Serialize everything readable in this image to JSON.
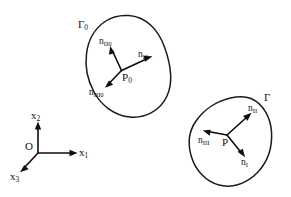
{
  "figure": {
    "background_color": "#ffffff",
    "stroke_color": "#1a1a1a",
    "width": 291,
    "height": 197
  },
  "coordinate_frame": {
    "origin_label": "O",
    "axes": [
      {
        "name": "x1",
        "base": "x",
        "sub": "1",
        "direction": "right"
      },
      {
        "name": "x2",
        "base": "x",
        "sub": "2",
        "direction": "up"
      },
      {
        "name": "x3",
        "base": "x",
        "sub": "3",
        "direction": "down-left"
      }
    ]
  },
  "bodies": [
    {
      "id": "reference-body",
      "boundary_label": {
        "base": "Γ",
        "sub": "0"
      },
      "point_label": {
        "base": "P",
        "sub": "0"
      },
      "vectors": [
        {
          "id": "n-I0",
          "base": "n",
          "sub": "I0",
          "direction": "up-right"
        },
        {
          "id": "n-II0",
          "base": "n",
          "sub": "II0",
          "direction": "up-left"
        },
        {
          "id": "n-III0",
          "base": "n",
          "sub": "III0",
          "direction": "down-left"
        }
      ]
    },
    {
      "id": "current-body",
      "boundary_label": {
        "base": "Γ",
        "sub": ""
      },
      "point_label": {
        "base": "P",
        "sub": ""
      },
      "vectors": [
        {
          "id": "n-I",
          "base": "n",
          "sub": "I",
          "direction": "down-right"
        },
        {
          "id": "n-II",
          "base": "n",
          "sub": "II",
          "direction": "up-right"
        },
        {
          "id": "n-III",
          "base": "n",
          "sub": "III",
          "direction": "left"
        }
      ]
    }
  ],
  "labels": {
    "gamma_zero_base": "Γ",
    "gamma_zero_sub": "0",
    "gamma_base": "Γ",
    "p_zero_base": "P",
    "p_zero_sub": "0",
    "p_base": "P",
    "n_I0_base": "n",
    "n_I0_sub": "I0",
    "n_II0_base": "n",
    "n_II0_sub": "II0",
    "n_III0_base": "n",
    "n_III0_sub": "III0",
    "n_I_base": "n",
    "n_I_sub": "I",
    "n_II_base": "n",
    "n_II_sub": "II",
    "n_III_base": "n",
    "n_III_sub": "III",
    "origin": "O",
    "x1_base": "x",
    "x1_sub": "1",
    "x2_base": "x",
    "x2_sub": "2",
    "x3_base": "x",
    "x3_sub": "3"
  }
}
